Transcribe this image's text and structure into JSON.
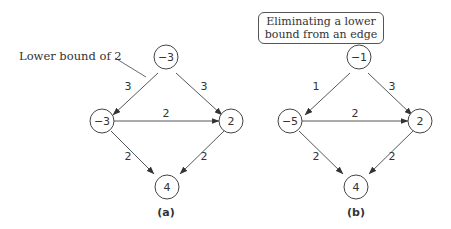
{
  "annotation": {
    "text": "Lower bound of 2"
  },
  "callout": {
    "line1": "Eliminating a lower",
    "line2": "bound from an edge"
  },
  "graphs": [
    {
      "caption": "(a)",
      "nodes": {
        "top": "−3",
        "left": "−3",
        "right": "2",
        "bottom": "4"
      },
      "edges": {
        "top_left": "3",
        "top_right": "3",
        "left_right": "2",
        "left_bottom": "2",
        "right_bottom": "2"
      }
    },
    {
      "caption": "(b)",
      "nodes": {
        "top": "−1",
        "left": "−5",
        "right": "2",
        "bottom": "4"
      },
      "edges": {
        "top_left": "1",
        "top_right": "3",
        "left_right": "2",
        "left_bottom": "2",
        "right_bottom": "2"
      }
    }
  ]
}
